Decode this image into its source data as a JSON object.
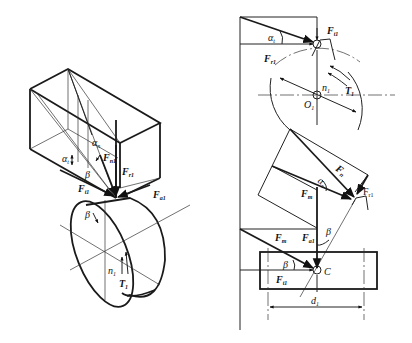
{
  "diagram": {
    "left_view": {
      "labels": {
        "alpha_t": "α",
        "alpha_t_sub": "t",
        "alpha_n": "α",
        "alpha_n_sub": "n",
        "F_n1": "F",
        "F_n1_sub": "n1",
        "F_r1": "F",
        "F_r1_sub": "r1",
        "F_t1": "F",
        "F_t1_sub": "t1",
        "F_a1": "F",
        "F_a1_sub": "a1",
        "beta": "β",
        "n1": "n",
        "n1_sub": "1",
        "T1": "T",
        "T1_sub": "1"
      }
    },
    "right_top_view": {
      "labels": {
        "F_r1": "F",
        "F_r1_sub": "r1",
        "alpha_t": "α",
        "alpha_t_sub": "t",
        "F_t1": "F",
        "F_t1_sub": "t1",
        "n1": "n",
        "n1_sub": "1",
        "O1": "O",
        "O1_sub": "1",
        "T1": "T",
        "T1_sub": "1"
      }
    },
    "right_bottom_view": {
      "labels": {
        "F_n": "F",
        "F_n_sub": "n",
        "alpha_n": "α",
        "alpha_n_sub": "n",
        "F_r1": "F",
        "F_r1_sub": "r1",
        "F_m": "F",
        "F_m_sub": "m",
        "F_m2": "F",
        "F_m2_sub": "m",
        "F_a1": "F",
        "F_a1_sub": "a1",
        "beta1": "β",
        "beta2": "β",
        "F_t1": "F",
        "F_t1_sub": "t1",
        "C": "C",
        "d1": "d",
        "d1_sub": "1"
      }
    }
  }
}
